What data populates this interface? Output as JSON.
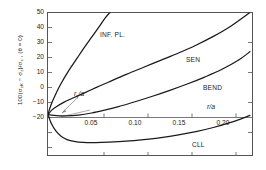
{
  "figure": {
    "axis": {
      "y_label_prefix": "100(",
      "y_label": "100(σ",
      "y_axis_title_full": "100(σzK − σz)/σz , (θ = 0)",
      "x_axis_title": "r/a",
      "y_ticks": [
        "50",
        "40",
        "30",
        "20",
        "10",
        "0",
        "−10",
        "−20"
      ],
      "x_ticks": [
        "0.05",
        "0.10",
        "0.15",
        "0.20"
      ]
    },
    "annotations": {
      "ry_a": "r",
      "ry_a_sub": "y",
      "ry_a_tail": "/a"
    },
    "curve_labels": {
      "inf_pl": "INF. PL.",
      "sen": "SEN",
      "bend": "BEND",
      "cll": "CLL"
    },
    "colors": {
      "line": "#1a1a1a",
      "frame": "#555555",
      "background": "#ffffff",
      "leader": "#8a8a8a"
    }
  },
  "chart_data": {
    "type": "line",
    "title": "",
    "xlabel": "r/a",
    "ylabel": "100(σzK − σz)/σz , (θ = 0)",
    "xlim": [
      0,
      0.235
    ],
    "ylim": [
      -20,
      50
    ],
    "xticks": [
      0.05,
      0.1,
      0.15,
      0.2
    ],
    "yticks": [
      -20,
      -10,
      0,
      10,
      20,
      30,
      40,
      50
    ],
    "grid": false,
    "legend": "inline-curve-labels",
    "annotations": [
      {
        "text": "r_y/a",
        "x": 0.022,
        "y": 4.5,
        "points_to": [
          0.012,
          0.4
        ]
      },
      {
        "text": "r/a",
        "x": 0.205,
        "y": 2.8
      }
    ],
    "series": [
      {
        "name": "INF. PL.",
        "label_pos": [
          0.052,
          37.5
        ],
        "x": [
          0,
          0.002,
          0.005,
          0.008,
          0.012,
          0.016,
          0.021,
          0.027,
          0.034,
          0.042,
          0.05,
          0.058,
          0.066,
          0.072
        ],
        "y": [
          0,
          3.0,
          6.4,
          9.3,
          12.8,
          16.0,
          19.6,
          23.6,
          28.0,
          33.0,
          37.8,
          42.6,
          47.5,
          50.4
        ]
      },
      {
        "name": "SEN",
        "label_pos": [
          0.178,
          28.5
        ],
        "x": [
          0,
          0.004,
          0.01,
          0.018,
          0.028,
          0.04,
          0.055,
          0.07,
          0.09,
          0.11,
          0.13,
          0.15,
          0.17,
          0.19,
          0.21,
          0.232
        ],
        "y": [
          0,
          2.1,
          4.0,
          6.0,
          8.0,
          10.3,
          13.2,
          16.0,
          19.7,
          23.2,
          26.7,
          30.2,
          34.0,
          38.3,
          43.3,
          50.0
        ]
      },
      {
        "name": "BEND",
        "label_pos": [
          0.196,
          16.5
        ],
        "x": [
          0,
          0.01,
          0.02,
          0.035,
          0.05,
          0.065,
          0.08,
          0.1,
          0.12,
          0.14,
          0.16,
          0.18,
          0.2,
          0.22,
          0.232
        ],
        "y": [
          0,
          -0.5,
          -0.6,
          -0.2,
          0.8,
          2.2,
          3.8,
          6.3,
          9.0,
          11.9,
          15.0,
          18.4,
          22.2,
          27.0,
          30.8
        ]
      },
      {
        "name": "CLL",
        "label_pos": [
          0.163,
          -12.2
        ],
        "x": [
          0,
          0.004,
          0.009,
          0.015,
          0.022,
          0.03,
          0.04,
          0.055,
          0.07,
          0.09,
          0.11,
          0.13,
          0.15,
          0.17,
          0.19,
          0.21,
          0.232
        ],
        "y": [
          0,
          -4.5,
          -8.0,
          -10.6,
          -12.2,
          -13.1,
          -13.6,
          -13.7,
          -13.5,
          -13.0,
          -12.2,
          -11.2,
          -9.9,
          -8.3,
          -6.3,
          -3.8,
          -0.4
        ]
      }
    ]
  }
}
